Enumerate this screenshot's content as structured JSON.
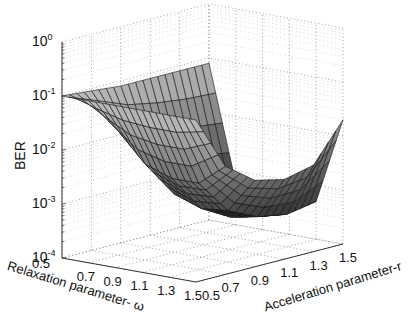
{
  "chart_data": {
    "type": "surface3d",
    "title": "",
    "xlabel": "Relaxation parameter- ω",
    "ylabel": "Acceleration parameter-r",
    "zlabel": "BER",
    "zscale": "log",
    "x_ticks": [
      "0.5",
      "0.7",
      "0.9",
      "1.1",
      "1.3",
      "1.5"
    ],
    "y_ticks": [
      "0.5",
      "0.7",
      "0.9",
      "1.1",
      "1.3",
      "1.5"
    ],
    "z_ticks": [
      {
        "base": "10",
        "exp": "0"
      },
      {
        "base": "10",
        "exp": "-1"
      },
      {
        "base": "10",
        "exp": "-2"
      },
      {
        "base": "10",
        "exp": "-3"
      },
      {
        "base": "10",
        "exp": "-4"
      }
    ],
    "xlim": [
      0.5,
      1.5
    ],
    "ylim": [
      0.5,
      1.5
    ],
    "zlim": [
      0.0001,
      1
    ],
    "grid": true,
    "colormap": "gray",
    "x": [
      0.5,
      0.7,
      0.9,
      1.1,
      1.3,
      1.5
    ],
    "y": [
      0.5,
      0.7,
      0.9,
      1.1,
      1.3,
      1.5
    ],
    "z_description": "BER surface, high (~1e-1) at r=0.5 edge and at omega=0.5 edge, dips to minimum ~3e-4 near omega~1.3-1.5, r~0.9-1.1",
    "z": [
      [
        0.1,
        0.1,
        0.1,
        0.1,
        0.1,
        0.1
      ],
      [
        0.09,
        0.02,
        0.006,
        0.004,
        0.004,
        0.01
      ],
      [
        0.08,
        0.004,
        0.0012,
        0.0008,
        0.0009,
        0.004
      ],
      [
        0.08,
        0.0015,
        0.0005,
        0.0004,
        0.0005,
        0.003
      ],
      [
        0.08,
        0.0008,
        0.0003,
        0.0003,
        0.0004,
        0.004
      ],
      [
        0.08,
        0.0006,
        0.0003,
        0.0003,
        0.0005,
        0.02
      ]
    ]
  }
}
